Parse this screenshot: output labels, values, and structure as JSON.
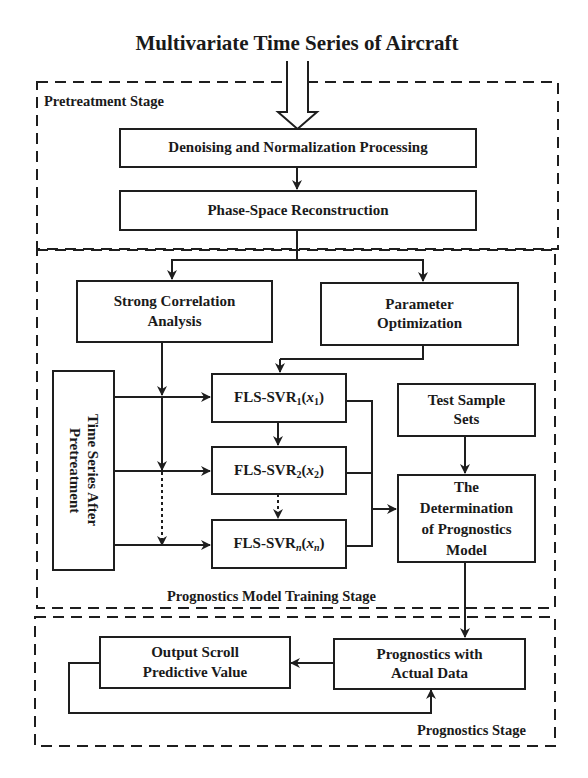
{
  "title": "Multivariate Time Series of Aircraft",
  "stages": {
    "pretreatment": {
      "label": "Pretreatment Stage"
    },
    "training": {
      "label": "Prognostics Model Training Stage"
    },
    "prognostics": {
      "label": "Prognostics Stage"
    }
  },
  "nodes": {
    "denoising": {
      "label": "Denoising and Normalization Processing"
    },
    "phase_space": {
      "label": "Phase-Space Reconstruction"
    },
    "strong_correlation": {
      "line1": "Strong Correlation",
      "line2": "Analysis"
    },
    "parameter_optimization": {
      "line1": "Parameter",
      "line2": "Optimization"
    },
    "time_series_after": {
      "line1": "Time Series After",
      "line2": "Pretreatment"
    },
    "fls1": {
      "prefix": "FLS-SVR",
      "sub": "1",
      "var": "x",
      "varsub": "1"
    },
    "fls2": {
      "prefix": "FLS-SVR",
      "sub": "2",
      "var": "x",
      "varsub": "2"
    },
    "flsn": {
      "prefix": "FLS-SVR",
      "sub": "n",
      "var": "x",
      "varsub": "n"
    },
    "test_sample_sets": {
      "line1": "Test Sample",
      "line2": "Sets"
    },
    "determination": {
      "line1": "The",
      "line2": "Determination",
      "line3": "of Prognostics",
      "line4": "Model"
    },
    "prognostics_actual": {
      "line1": "Prognostics with",
      "line2": "Actual Data"
    },
    "output_scroll": {
      "line1": "Output Scroll",
      "line2": "Predictive Value"
    }
  },
  "colors": {
    "stroke": "#1e1e1e",
    "background": "#ffffff"
  }
}
